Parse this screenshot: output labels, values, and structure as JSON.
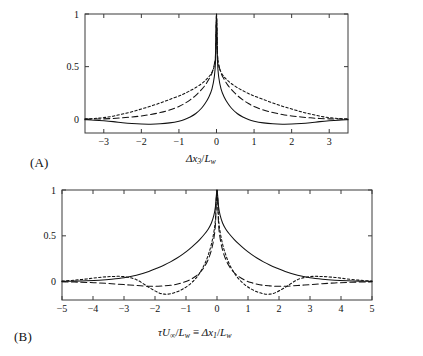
{
  "figure": {
    "panels": [
      {
        "id": "A",
        "label": "(A)",
        "xaxis_label_parts": {
          "delta": "Δ",
          "x": "x",
          "xsub": "3",
          "slash": "/",
          "L": "L",
          "Lsub": "w"
        },
        "xaxis_label_plain": "Δx₃/Lᵥᵥ",
        "ytick_labels": [
          "0",
          "0.5",
          "1"
        ],
        "xtick_labels": [
          "−3",
          "−2",
          "−1",
          "0",
          "1",
          "2",
          "3"
        ]
      },
      {
        "id": "B",
        "label": "(B)",
        "xaxis_label_parts": {
          "tau": "τ",
          "U": "U",
          "Usub": "∞",
          "slash1": "/",
          "L1": "L",
          "L1sub": "w",
          "equiv": "≡",
          "delta": "Δ",
          "x": "x",
          "xsub": "1",
          "slash2": "/",
          "L2": "L",
          "L2sub": "w"
        },
        "xaxis_label_plain": "τU∞/Lᵥ ≡ Δx₁/Lᵥ",
        "ytick_labels": [
          "0",
          "0.5",
          "1"
        ],
        "xtick_labels": [
          "−5",
          "−4",
          "−3",
          "−2",
          "−1",
          "0",
          "1",
          "2",
          "3",
          "4",
          "5"
        ]
      }
    ]
  },
  "chart_data": [
    {
      "type": "line",
      "panel": "A",
      "title": "",
      "xlabel": "Δx₃/Lᵥ",
      "ylabel": "",
      "xlim": [
        -3.5,
        3.5
      ],
      "ylim": [
        -0.13,
        1.0
      ],
      "xticks": [
        -3,
        -2,
        -1,
        0,
        1,
        2,
        3
      ],
      "yticks": [
        0,
        0.5,
        1
      ],
      "grid": false,
      "legend": "none",
      "x": [
        -3.5,
        -3.25,
        -3.0,
        -2.75,
        -2.5,
        -2.25,
        -2.0,
        -1.75,
        -1.5,
        -1.25,
        -1.0,
        -0.85,
        -0.7,
        -0.55,
        -0.4,
        -0.3,
        -0.2,
        -0.12,
        -0.06,
        -0.025,
        0,
        0.025,
        0.06,
        0.12,
        0.2,
        0.3,
        0.4,
        0.55,
        0.7,
        0.85,
        1.0,
        1.25,
        1.5,
        1.75,
        2.0,
        2.25,
        2.5,
        2.75,
        3.0,
        3.25,
        3.5
      ],
      "series": [
        {
          "name": "solid",
          "style": "solid",
          "values": [
            -0.004,
            -0.008,
            -0.014,
            -0.022,
            -0.032,
            -0.04,
            -0.045,
            -0.046,
            -0.043,
            -0.034,
            -0.018,
            -0.002,
            0.022,
            0.055,
            0.105,
            0.152,
            0.215,
            0.29,
            0.4,
            0.56,
            1.0,
            0.56,
            0.4,
            0.29,
            0.215,
            0.152,
            0.105,
            0.055,
            0.022,
            -0.002,
            -0.018,
            -0.034,
            -0.043,
            -0.046,
            -0.045,
            -0.04,
            -0.032,
            -0.022,
            -0.014,
            -0.008,
            -0.004
          ]
        },
        {
          "name": "long-dashed",
          "style": "longdash",
          "values": [
            0.001,
            0.002,
            0.004,
            0.008,
            0.014,
            0.022,
            0.032,
            0.046,
            0.064,
            0.088,
            0.122,
            0.15,
            0.185,
            0.228,
            0.282,
            0.325,
            0.382,
            0.44,
            0.52,
            0.63,
            1.0,
            0.63,
            0.52,
            0.44,
            0.382,
            0.325,
            0.282,
            0.228,
            0.185,
            0.15,
            0.122,
            0.088,
            0.064,
            0.046,
            0.032,
            0.022,
            0.014,
            0.008,
            0.004,
            0.002,
            0.001
          ]
        },
        {
          "name": "dotted",
          "style": "dotted",
          "values": [
            0.004,
            0.008,
            0.016,
            0.03,
            0.05,
            0.072,
            0.098,
            0.125,
            0.155,
            0.188,
            0.222,
            0.245,
            0.272,
            0.302,
            0.338,
            0.368,
            0.405,
            0.448,
            0.51,
            0.62,
            1.0,
            0.62,
            0.51,
            0.448,
            0.405,
            0.368,
            0.338,
            0.302,
            0.272,
            0.245,
            0.222,
            0.188,
            0.155,
            0.125,
            0.098,
            0.072,
            0.05,
            0.03,
            0.016,
            0.008,
            0.004
          ]
        }
      ]
    },
    {
      "type": "line",
      "panel": "B",
      "title": "",
      "xlabel": "τU∞/Lᵥ ≡ Δx₁/Lᵥ",
      "ylabel": "",
      "xlim": [
        -5,
        5
      ],
      "ylim": [
        -0.2,
        1.0
      ],
      "xticks": [
        -5,
        -4,
        -3,
        -2,
        -1,
        0,
        1,
        2,
        3,
        4,
        5
      ],
      "yticks": [
        0,
        0.5,
        1
      ],
      "grid": false,
      "legend": "none",
      "x": [
        -5.0,
        -4.6,
        -4.2,
        -3.8,
        -3.4,
        -3.0,
        -2.6,
        -2.2,
        -1.9,
        -1.7,
        -1.5,
        -1.3,
        -1.1,
        -0.9,
        -0.7,
        -0.55,
        -0.4,
        -0.28,
        -0.18,
        -0.1,
        -0.05,
        0,
        0.05,
        0.1,
        0.18,
        0.28,
        0.4,
        0.55,
        0.7,
        0.9,
        1.1,
        1.3,
        1.5,
        1.7,
        1.9,
        2.2,
        2.6,
        3.0,
        3.4,
        3.8,
        4.2,
        4.6,
        5.0
      ],
      "series": [
        {
          "name": "solid",
          "style": "solid",
          "values": [
            0.004,
            0.006,
            0.01,
            0.016,
            0.026,
            0.042,
            0.07,
            0.112,
            0.152,
            0.182,
            0.216,
            0.255,
            0.3,
            0.352,
            0.412,
            0.462,
            0.52,
            0.575,
            0.64,
            0.725,
            0.82,
            1.0,
            0.82,
            0.725,
            0.64,
            0.575,
            0.52,
            0.462,
            0.412,
            0.352,
            0.3,
            0.255,
            0.216,
            0.182,
            0.152,
            0.112,
            0.07,
            0.042,
            0.026,
            0.016,
            0.01,
            0.006,
            0.004
          ]
        },
        {
          "name": "long-dashed",
          "style": "longdash",
          "values": [
            -0.002,
            -0.004,
            -0.008,
            -0.014,
            -0.022,
            -0.032,
            -0.042,
            -0.05,
            -0.05,
            -0.046,
            -0.04,
            -0.028,
            -0.01,
            0.016,
            0.056,
            0.1,
            0.165,
            0.245,
            0.345,
            0.475,
            0.63,
            1.0,
            0.63,
            0.475,
            0.345,
            0.245,
            0.165,
            0.1,
            0.056,
            0.016,
            -0.01,
            -0.028,
            -0.04,
            -0.046,
            -0.05,
            -0.05,
            -0.042,
            -0.032,
            -0.022,
            -0.014,
            -0.008,
            -0.004,
            -0.002
          ]
        },
        {
          "name": "dotted",
          "style": "dotted",
          "values": [
            0.006,
            0.016,
            0.03,
            0.046,
            0.056,
            0.055,
            0.022,
            -0.062,
            -0.118,
            -0.136,
            -0.132,
            -0.112,
            -0.08,
            -0.035,
            0.03,
            0.098,
            0.19,
            0.295,
            0.41,
            0.545,
            0.69,
            1.0,
            0.69,
            0.545,
            0.41,
            0.295,
            0.19,
            0.098,
            0.03,
            -0.035,
            -0.08,
            -0.112,
            -0.132,
            -0.136,
            -0.118,
            -0.062,
            0.022,
            0.055,
            0.056,
            0.046,
            0.03,
            0.016,
            0.006
          ]
        }
      ]
    }
  ]
}
